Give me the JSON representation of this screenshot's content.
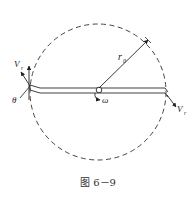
{
  "figure": {
    "caption": "图 6－9",
    "labels": {
      "radius": "r",
      "radius_sub": "0",
      "omega": "ω",
      "theta": "θ",
      "v_left": "V",
      "v_left_sub": "r",
      "v_right": "V",
      "v_right_sub": "r"
    },
    "colors": {
      "stroke": "#2a2a2a",
      "dashed_circle": "#444444"
    }
  }
}
